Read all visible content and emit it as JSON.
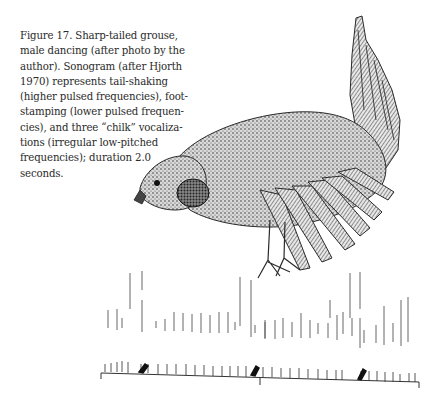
{
  "caption": {
    "lines": [
      "Figure 17. Sharp-tailed grouse,",
      "male dancing (after photo by the",
      "author). Sonogram (after Hjorth",
      "1970) represents tail-shaking",
      "(higher pulsed frequencies), foot-",
      "stamping (lower pulsed frequen-",
      "cies), and three “chilk” vocaliza-",
      "tions (irregular low-pitched",
      "frequencies); duration 2.0",
      "seconds."
    ]
  },
  "illustration": {
    "subject": "sharp-tailed grouse male dancing",
    "icon": "bird-illustration"
  },
  "sonogram": {
    "duration_seconds": 2.0,
    "time_axis_ticks": 3,
    "upper_band": "tail-shaking",
    "lower_band": "foot-stamping",
    "vocalizations": 3
  },
  "colors": {
    "ink": "#2a2a2a",
    "paper": "#ffffff"
  }
}
